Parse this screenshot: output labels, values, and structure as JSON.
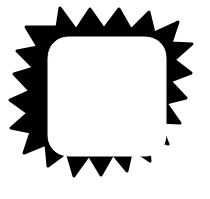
{
  "canvas": {
    "width": 210,
    "height": 199,
    "background_color": "#ffffff"
  },
  "artwork": {
    "title": "Spiky Sunburst Rounded Square Badge",
    "alt_text": "Black hand-drawn spiky rounded square outline with hollow white center",
    "style": "flat monochrome silhouette, hand-drawn irregular spikes",
    "fill_color": "#000000",
    "center_color": "#ffffff",
    "stroke": "none",
    "shape_type": "starburst-rounded-square",
    "spike_count": 17,
    "spike_counts_per_edge": {
      "top": 5,
      "right": 4,
      "bottom": 4,
      "left": 4
    },
    "outer_bounds": {
      "x": 16,
      "y": 8,
      "width": 176,
      "height": 180
    },
    "inner_bounds": {
      "x": 48,
      "y": 37,
      "width": 118,
      "height": 119
    },
    "inner_corner_radius": 21,
    "outer_path": "M 57 27 L 60 8 L 76 30 L 90 9 L 104 29 L 119 9 L 131 30 L 149 12 L 154 33 L 178 22 L 171 43 L 192 44 L 174 60 L 191 73 L 170 81 L 186 98 L 166 103 L 180 123 L 159 122 L 168 144 L 148 137 L 150 161 L 132 149 L 127 171 L 113 154 L 101 175 L 89 155 L 74 176 L 67 152 L 48 166 L 46 144 L 24 153 L 31 132 L 11 128 L 28 113 L 10 100 L 30 91 L 14 74 L 34 68 L 17 51 L 38 47 L 26 27 Z",
    "inner_path": "M 69 37 C 56 37 48 46 48 59 L 48 135 C 48 148 57 156 70 156 L 145 156 C 158 156 166 147 166 134 L 166 58 C 166 45 157 37 144 37 Z"
  }
}
